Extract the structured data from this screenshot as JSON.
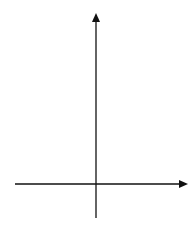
{
  "graph": {
    "x_axis_label": "x",
    "y_axis_label": "y",
    "x_range": [
      -5,
      5
    ],
    "y_range": [
      -2,
      10
    ],
    "x_ticks": [
      "−4",
      "−3",
      "−2",
      "−1",
      "0",
      "1",
      "2",
      "3",
      "4"
    ],
    "y_ticks": [
      "9",
      "8",
      "7",
      "6",
      "5",
      "4",
      "3",
      "2",
      "1",
      "−1"
    ],
    "grid_color": "#c8c8c8",
    "axis_color": "#111111"
  }
}
